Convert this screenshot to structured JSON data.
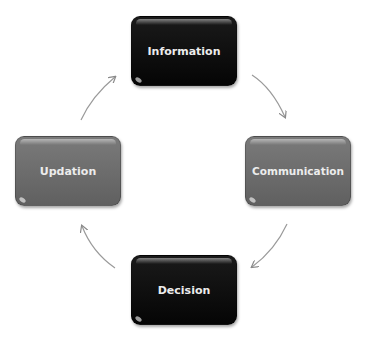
{
  "diagram": {
    "type": "cycle",
    "nodes": [
      {
        "id": "information",
        "label": "Information",
        "color": "#0a0a0a"
      },
      {
        "id": "communication",
        "label": "Communication",
        "color": "#6b6b6b"
      },
      {
        "id": "decision",
        "label": "Decision",
        "color": "#0a0a0a"
      },
      {
        "id": "updation",
        "label": "Updation",
        "color": "#6b6b6b"
      }
    ],
    "edges": [
      {
        "from": "information",
        "to": "communication"
      },
      {
        "from": "communication",
        "to": "decision"
      },
      {
        "from": "decision",
        "to": "updation"
      },
      {
        "from": "updation",
        "to": "information"
      }
    ],
    "arrow_color": "#8a8a8a"
  }
}
